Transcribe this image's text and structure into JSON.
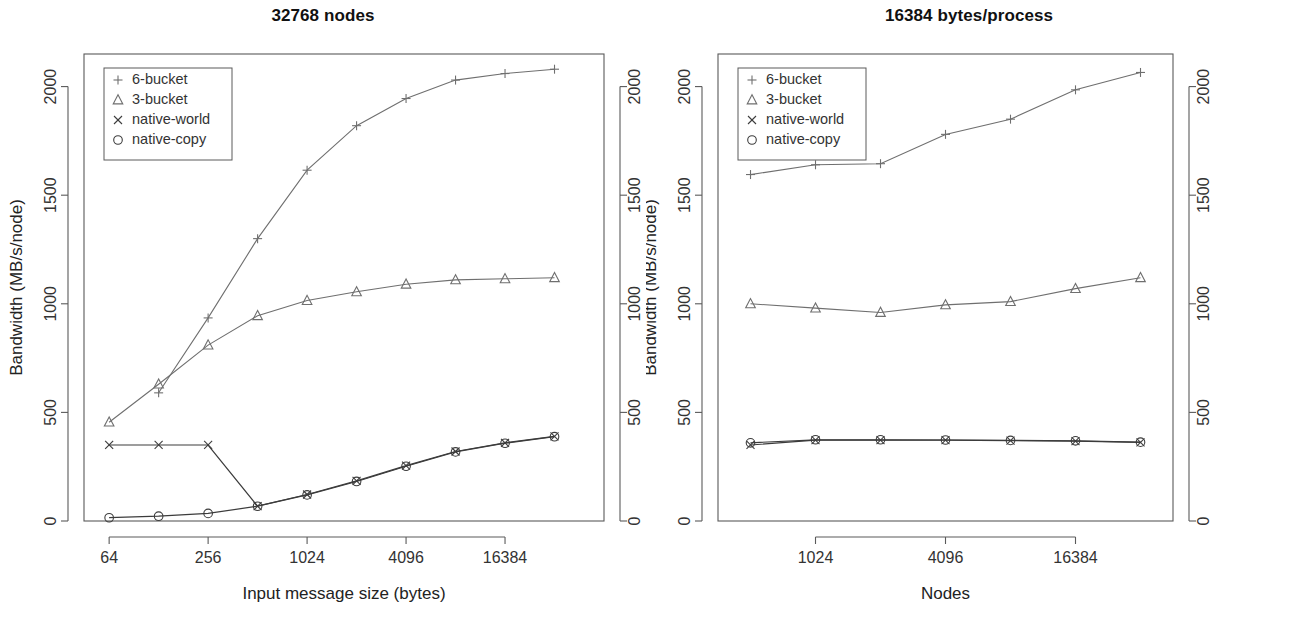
{
  "figure": {
    "panels": [
      {
        "id": "left",
        "title": "32768 nodes",
        "xlabel": "Input message size (bytes)",
        "ylabel": "Bandwidth (MB/s/node)",
        "xticks": [
          "64",
          "256",
          "1024",
          "4096",
          "16384"
        ],
        "yticks": [
          "0",
          "500",
          "1000",
          "1500",
          "2000"
        ]
      },
      {
        "id": "right",
        "title": "16384 bytes/process",
        "xlabel": "Nodes",
        "ylabel": "Bandwidth (MB/s/node)",
        "xticks": [
          "1024",
          "4096",
          "16384"
        ],
        "yticks": [
          "0",
          "500",
          "1000",
          "1500",
          "2000"
        ]
      }
    ],
    "legend": {
      "entries": [
        {
          "marker": "plus-icon",
          "label": "6-bucket"
        },
        {
          "marker": "triangle-icon",
          "label": "3-bucket"
        },
        {
          "marker": "cross-icon",
          "label": "native-world"
        },
        {
          "marker": "circle-icon",
          "label": "native-copy"
        }
      ]
    }
  },
  "chart_data": [
    {
      "type": "line",
      "title": "32768 nodes",
      "xlabel": "Input message size (bytes)",
      "ylabel": "Bandwidth (MB/s/node)",
      "xscale": "log2",
      "xlim": [
        45,
        65536
      ],
      "ylim": [
        0,
        2150
      ],
      "xticks": [
        64,
        256,
        1024,
        4096,
        16384
      ],
      "yticks": [
        0,
        500,
        1000,
        1500,
        2000
      ],
      "grid": false,
      "legend_position": "top-left",
      "x": [
        64,
        128,
        256,
        512,
        1024,
        2048,
        4096,
        8192,
        16384,
        32768
      ],
      "series": [
        {
          "name": "6-bucket",
          "marker": "plus",
          "values": [
            null,
            590,
            935,
            1300,
            1615,
            1820,
            1945,
            2030,
            2060,
            2080
          ]
        },
        {
          "name": "3-bucket",
          "marker": "triangle",
          "values": [
            455,
            630,
            810,
            945,
            1015,
            1055,
            1090,
            1110,
            1115,
            1120
          ]
        },
        {
          "name": "native-world",
          "marker": "cross",
          "values": [
            350,
            350,
            350,
            68,
            122,
            185,
            255,
            320,
            360,
            390
          ]
        },
        {
          "name": "native-copy",
          "marker": "circle",
          "values": [
            15,
            22,
            35,
            68,
            120,
            182,
            252,
            318,
            358,
            388
          ]
        }
      ]
    },
    {
      "type": "line",
      "title": "16384 bytes/process",
      "xlabel": "Nodes",
      "ylabel": "Bandwidth (MB/s/node)",
      "xscale": "log2",
      "xlim": [
        362,
        46341
      ],
      "ylim": [
        0,
        2150
      ],
      "xticks": [
        1024,
        4096,
        16384
      ],
      "yticks": [
        0,
        500,
        1000,
        1500,
        2000
      ],
      "grid": false,
      "legend_position": "top-left",
      "x": [
        512,
        1024,
        2048,
        4096,
        8192,
        16384,
        32768
      ],
      "series": [
        {
          "name": "6-bucket",
          "marker": "plus",
          "values": [
            1595,
            1640,
            1645,
            1780,
            1850,
            1985,
            2065
          ]
        },
        {
          "name": "3-bucket",
          "marker": "triangle",
          "values": [
            1000,
            980,
            960,
            995,
            1010,
            1070,
            1120
          ]
        },
        {
          "name": "native-world",
          "marker": "cross",
          "values": [
            350,
            372,
            372,
            372,
            370,
            368,
            362
          ]
        },
        {
          "name": "native-copy",
          "marker": "circle",
          "values": [
            360,
            374,
            374,
            373,
            371,
            369,
            363
          ]
        }
      ]
    }
  ]
}
